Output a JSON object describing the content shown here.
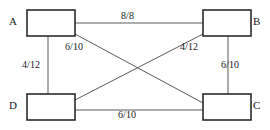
{
  "diagram": {
    "type": "network-flow-graph",
    "background_color": "#ffffff",
    "node_stroke_color": "#2b2b2b",
    "edge_stroke_color": "#5a5a5a",
    "text_color": "#1a1a1a",
    "nodes": [
      {
        "id": "A",
        "label": "A",
        "position": "top-left",
        "label_x": 9,
        "label_y": 16,
        "box": {
          "x": 27,
          "y": 10,
          "w": 48,
          "h": 26
        }
      },
      {
        "id": "B",
        "label": "B",
        "position": "top-right",
        "label_x": 253,
        "label_y": 16,
        "box": {
          "x": 203,
          "y": 10,
          "w": 48,
          "h": 26
        }
      },
      {
        "id": "C",
        "label": "C",
        "position": "bottom-right",
        "label_x": 253,
        "label_y": 100,
        "box": {
          "x": 203,
          "y": 94,
          "w": 48,
          "h": 26
        }
      },
      {
        "id": "D",
        "label": "D",
        "position": "bottom-left",
        "label_x": 9,
        "label_y": 100,
        "box": {
          "x": 27,
          "y": 94,
          "w": 48,
          "h": 26
        }
      }
    ],
    "edges": [
      {
        "id": "edge-a-b",
        "from": "A",
        "to": "B",
        "label": "8/8",
        "flow": 8,
        "capacity": 8,
        "label_x": 121,
        "label_y": 11,
        "orientation": "horizontal-top"
      },
      {
        "id": "edge-a-c",
        "from": "A",
        "to": "C",
        "label": "6/10",
        "flow": 6,
        "capacity": 10,
        "label_x": 65,
        "label_y": 42,
        "orientation": "diagonal-down-right"
      },
      {
        "id": "edge-d-b",
        "from": "D",
        "to": "B",
        "label": "4/12",
        "flow": 4,
        "capacity": 12,
        "label_x": 180,
        "label_y": 42,
        "orientation": "diagonal-up-right"
      },
      {
        "id": "edge-a-d",
        "from": "A",
        "to": "D",
        "label": "4/12",
        "flow": 4,
        "capacity": 12,
        "label_x": 22,
        "label_y": 60,
        "orientation": "vertical-left"
      },
      {
        "id": "edge-b-c",
        "from": "B",
        "to": "C",
        "label": "6/10",
        "flow": 6,
        "capacity": 10,
        "label_x": 221,
        "label_y": 60,
        "orientation": "vertical-right"
      },
      {
        "id": "edge-d-c",
        "from": "D",
        "to": "C",
        "label": "6/10",
        "flow": 6,
        "capacity": 10,
        "label_x": 118,
        "label_y": 110,
        "orientation": "horizontal-bottom"
      }
    ]
  }
}
